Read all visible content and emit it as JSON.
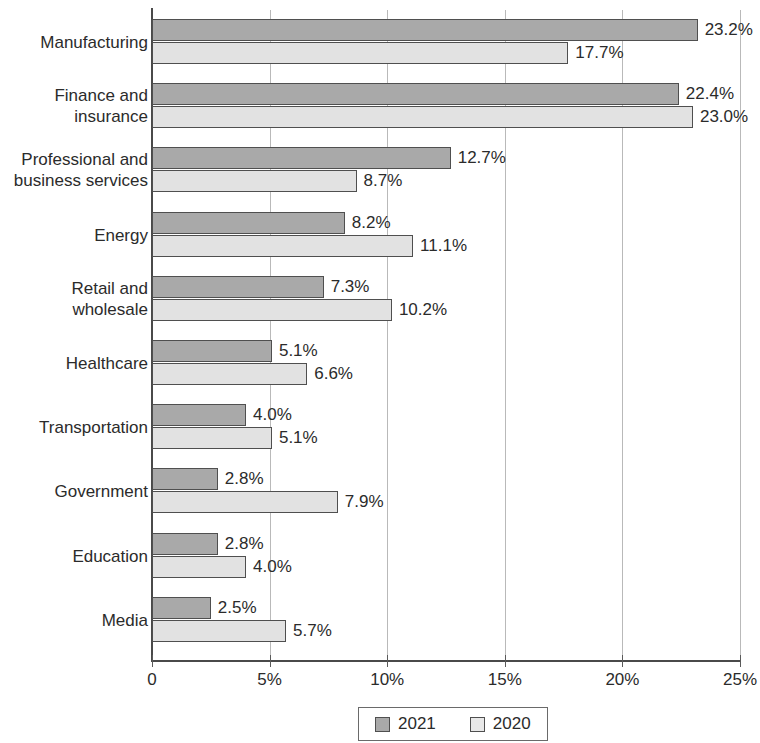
{
  "chart_data": {
    "type": "bar",
    "orientation": "horizontal",
    "title": "",
    "subtitle": "",
    "xlabel": "",
    "ylabel": "",
    "xlim": [
      0,
      25
    ],
    "grid": true,
    "legend_position": "bottom",
    "xticks": [
      {
        "value": 0,
        "label": "0"
      },
      {
        "value": 5,
        "label": "5%"
      },
      {
        "value": 10,
        "label": "10%"
      },
      {
        "value": 15,
        "label": "15%"
      },
      {
        "value": 20,
        "label": "20%"
      },
      {
        "value": 25,
        "label": "25%"
      }
    ],
    "categories": [
      "Manufacturing",
      "Finance and\ninsurance",
      "Professional and\nbusiness services",
      "Energy",
      "Retail and\nwholesale",
      "Healthcare",
      "Transportation",
      "Government",
      "Education",
      "Media"
    ],
    "series": [
      {
        "name": "2021",
        "color": "#a9a9a9",
        "values": [
          23.2,
          22.4,
          12.7,
          8.2,
          7.3,
          5.1,
          4.0,
          2.8,
          2.8,
          2.5
        ],
        "labels": [
          "23.2%",
          "22.4%",
          "12.7%",
          "8.2%",
          "7.3%",
          "5.1%",
          "4.0%",
          "2.8%",
          "2.8%",
          "2.5%"
        ]
      },
      {
        "name": "2020",
        "color": "#e2e2e2",
        "values": [
          17.7,
          23.0,
          8.7,
          11.1,
          10.2,
          6.6,
          5.1,
          7.9,
          4.0,
          5.7
        ],
        "labels": [
          "17.7%",
          "23.0%",
          "8.7%",
          "11.1%",
          "10.2%",
          "6.6%",
          "5.1%",
          "7.9%",
          "4.0%",
          "5.7%"
        ]
      }
    ]
  },
  "legend": {
    "items": [
      {
        "label": "2021"
      },
      {
        "label": "2020"
      }
    ]
  }
}
